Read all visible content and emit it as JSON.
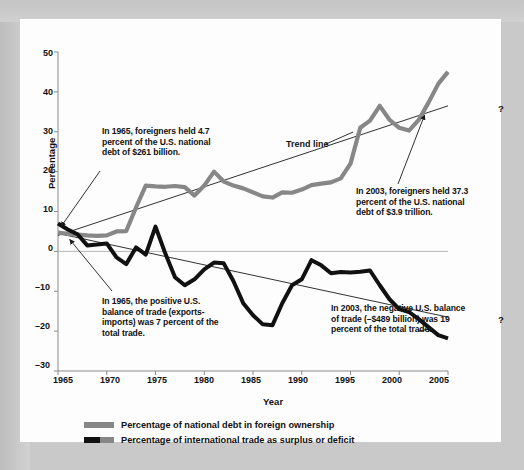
{
  "figure": {
    "background_color": "#c9c9c9",
    "panel_color": "#fdfdfd"
  },
  "axes": {
    "ylabel": "Percentage",
    "xlabel": "Year",
    "yticks": [
      "50",
      "40",
      "30",
      "20",
      "10",
      "0",
      "–10",
      "–20",
      "–30"
    ],
    "xticks": [
      "1965",
      "1970",
      "1975",
      "1980",
      "1985",
      "1990",
      "1995",
      "2000",
      "2005"
    ],
    "ylim": [
      -30,
      50
    ],
    "xlim": [
      1965,
      2005
    ]
  },
  "annotations": {
    "debt_1965": "In 1965, foreigners held 4.7 percent of the U.S. national debt of $261 billion.",
    "debt_2003": "In 2003, foreigners held 37.3 percent of the U.S. national debt of $3.9 trillion.",
    "trade_1965": "In 1965, the positive U.S. balance of trade (exports-imports) was 7 percent of the total trade.",
    "trade_2003": "In 2003, the negative U.S. balance of trade (–$489 billion) was 19 percent of the total trade.",
    "trend_label": "Trend line",
    "question_top": "?",
    "question_bottom": "?"
  },
  "legend": {
    "items": [
      {
        "label": "Percentage of national debt in foreign ownership",
        "color": "#878787"
      },
      {
        "label": "Percentage of international trade as surplus or deficit",
        "color": "#111111"
      }
    ]
  },
  "chart_data": {
    "type": "line",
    "title": "",
    "xlabel": "Year",
    "ylabel": "Percentage",
    "xlim": [
      1965,
      2005
    ],
    "ylim": [
      -30,
      50
    ],
    "grid": false,
    "legend_position": "below",
    "x": [
      1965,
      1966,
      1967,
      1968,
      1969,
      1970,
      1971,
      1972,
      1973,
      1974,
      1975,
      1976,
      1977,
      1978,
      1979,
      1980,
      1981,
      1982,
      1983,
      1984,
      1985,
      1986,
      1987,
      1988,
      1989,
      1990,
      1991,
      1992,
      1993,
      1994,
      1995,
      1996,
      1997,
      1998,
      1999,
      2000,
      2001,
      2002,
      2003,
      2004,
      2005
    ],
    "series": [
      {
        "name": "Percentage of national debt in foreign ownership",
        "color": "#878787",
        "values": [
          4.7,
          4.4,
          4.2,
          4.0,
          3.9,
          4.0,
          5.0,
          5.1,
          11.0,
          16.5,
          16.3,
          16.2,
          16.4,
          16.1,
          14.0,
          16.5,
          20.0,
          17.5,
          16.5,
          15.8,
          14.8,
          13.8,
          13.5,
          14.8,
          14.7,
          15.5,
          16.6,
          17.0,
          17.3,
          18.3,
          22.0,
          31.0,
          32.8,
          36.5,
          33.0,
          31.0,
          30.3,
          33.0,
          37.3,
          42.0,
          45.0
        ]
      },
      {
        "name": "Percentage of international trade as surplus or deficit",
        "color": "#111111",
        "values": [
          7.0,
          5.5,
          4.3,
          1.5,
          1.7,
          2.0,
          -1.5,
          -3.2,
          1.0,
          -0.8,
          6.2,
          -0.5,
          -6.5,
          -8.5,
          -7.0,
          -4.5,
          -2.8,
          -3.0,
          -7.5,
          -13.0,
          -16.0,
          -18.3,
          -18.5,
          -13.0,
          -8.5,
          -7.0,
          -2.2,
          -3.5,
          -5.5,
          -5.2,
          -5.3,
          -5.1,
          -4.8,
          -8.5,
          -12.0,
          -14.5,
          -15.2,
          -17.0,
          -19.0,
          -21.0,
          -21.8
        ]
      }
    ],
    "trend_lines": [
      {
        "name": "debt-trend",
        "x0": 1965,
        "y0": 4.0,
        "x1": 2005,
        "y1": 36.5
      },
      {
        "name": "trade-trend",
        "x0": 1965,
        "y0": 4.5,
        "x1": 2005,
        "y1": -16.5
      }
    ]
  }
}
